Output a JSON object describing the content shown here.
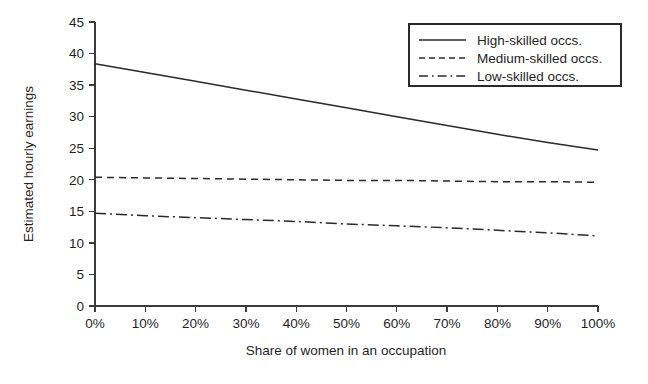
{
  "chart_data": {
    "type": "line",
    "title": "",
    "xlabel": "Share of women in an occupation",
    "ylabel": "Estimated hourly earnings",
    "x": [
      0,
      10,
      20,
      30,
      40,
      50,
      60,
      70,
      80,
      90,
      100
    ],
    "xticklabels": [
      "0%",
      "10%",
      "20%",
      "30%",
      "40%",
      "50%",
      "60%",
      "70%",
      "80%",
      "90%",
      "100%"
    ],
    "yticklabels": [
      "0",
      "5",
      "10",
      "15",
      "20",
      "25",
      "30",
      "35",
      "40",
      "45"
    ],
    "yticks": [
      0,
      5,
      10,
      15,
      20,
      25,
      30,
      35,
      40,
      45
    ],
    "xlim": [
      0,
      100
    ],
    "ylim": [
      0,
      45
    ],
    "grid": false,
    "legend_position": "top-right",
    "series": [
      {
        "name": "High-skilled occs.",
        "style": "solid",
        "values": [
          38.4,
          37.0,
          35.6,
          34.2,
          32.8,
          31.4,
          30.0,
          28.6,
          27.2,
          25.9,
          24.7
        ]
      },
      {
        "name": "Medium-skilled occs.",
        "style": "dashed",
        "values": [
          20.4,
          20.3,
          20.2,
          20.1,
          20.0,
          19.9,
          19.9,
          19.8,
          19.7,
          19.7,
          19.6
        ]
      },
      {
        "name": "Low-skilled occs.",
        "style": "dash-dot",
        "values": [
          14.7,
          14.3,
          14.0,
          13.7,
          13.4,
          13.0,
          12.7,
          12.4,
          12.0,
          11.6,
          11.1
        ]
      }
    ]
  },
  "legend": {
    "entries": [
      {
        "label": "High-skilled occs."
      },
      {
        "label": "Medium-skilled occs."
      },
      {
        "label": "Low-skilled occs."
      }
    ]
  },
  "colors": {
    "ink": "#2a2a2a",
    "background": "#ffffff"
  }
}
